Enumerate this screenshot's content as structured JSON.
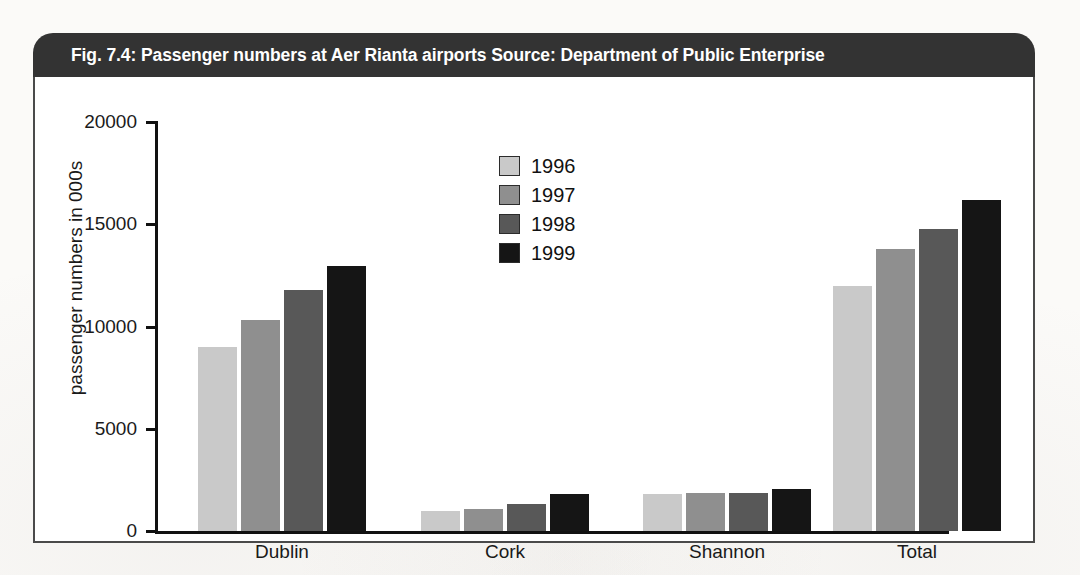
{
  "figure": {
    "title": "Fig. 7.4: Passenger numbers at Aer Rianta airports  Source: Department of Public Enterprise"
  },
  "chart_data": {
    "type": "bar",
    "title": "Fig. 7.4: Passenger numbers at Aer Rianta airports  Source: Department of Public Enterprise",
    "source": "Department of Public Enterprise",
    "xlabel": "",
    "ylabel": "passenger numbers in 000s",
    "categories": [
      "Dublin",
      "Cork",
      "Shannon",
      "Total"
    ],
    "ylim": [
      0,
      20000
    ],
    "yticks": [
      0,
      5000,
      10000,
      15000,
      20000
    ],
    "ytick_labels": [
      "0",
      "5000",
      "10000",
      "15000",
      "20000"
    ],
    "grid": false,
    "legend_position": "upper center",
    "series": [
      {
        "name": "1996",
        "color": "#c9c9c9",
        "values": [
          9000,
          1000,
          1800,
          12000
        ]
      },
      {
        "name": "1997",
        "color": "#8f8f8f",
        "values": [
          10300,
          1100,
          1850,
          13800
        ]
      },
      {
        "name": "1998",
        "color": "#585858",
        "values": [
          11800,
          1300,
          1850,
          14750
        ]
      },
      {
        "name": "1999",
        "color": "#151515",
        "values": [
          12950,
          1800,
          2050,
          16200
        ]
      }
    ]
  }
}
